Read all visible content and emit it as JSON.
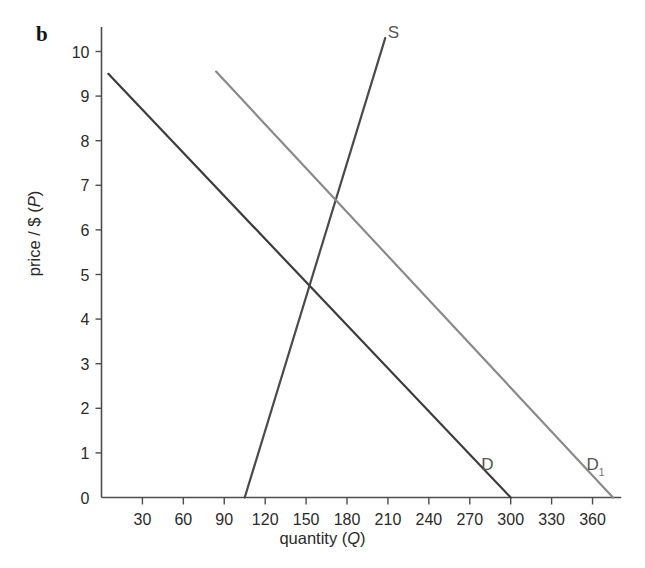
{
  "figure": {
    "panel_label": "b",
    "background": "#ffffff"
  },
  "chart_data": {
    "type": "line",
    "title": "",
    "xlabel": "quantity (Q)",
    "ylabel": "price / $ (P)",
    "xlabel_plain": "quantity",
    "xlabel_italic": "Q",
    "ylabel_plain": "price / $",
    "ylabel_italic": "P",
    "xlim": [
      0,
      375
    ],
    "ylim": [
      0,
      10
    ],
    "xticks": [
      0,
      30,
      60,
      90,
      120,
      150,
      180,
      210,
      240,
      270,
      300,
      330,
      360
    ],
    "xtick_labels": [
      "0",
      "30",
      "60",
      "90",
      "120",
      "150",
      "180",
      "210",
      "240",
      "270",
      "300",
      "330",
      "360"
    ],
    "yticks": [
      0,
      1,
      2,
      3,
      4,
      5,
      6,
      7,
      8,
      9,
      10
    ],
    "ytick_labels": [
      "0",
      "1",
      "2",
      "3",
      "4",
      "5",
      "6",
      "7",
      "8",
      "9",
      "10"
    ],
    "grid": false,
    "legend_position": "inline-end-labels",
    "series": [
      {
        "name": "D",
        "label": "D",
        "label_sub": "",
        "color": "#3c3c3c",
        "width": 2.2,
        "points": [
          [
            5,
            9.5
          ],
          [
            300,
            0
          ]
        ],
        "label_at": [
          283,
          0.62
        ]
      },
      {
        "name": "S",
        "label": "S",
        "label_sub": "",
        "color": "#4a4a4a",
        "width": 2.2,
        "points": [
          [
            105,
            0
          ],
          [
            208,
            10.3
          ]
        ],
        "label_at": [
          214,
          10.3
        ]
      },
      {
        "name": "D1",
        "label": "D",
        "label_sub": "1",
        "color": "#8a8a8a",
        "width": 2.2,
        "points": [
          [
            84,
            9.55
          ],
          [
            375,
            0
          ]
        ],
        "label_at": [
          360,
          0.62
        ]
      }
    ],
    "intersections": [
      {
        "name": "equilibrium-D-S",
        "q": 150,
        "p": 4.95
      },
      {
        "name": "equilibrium-D1-S",
        "q": 180,
        "p": 6.8
      }
    ],
    "annotations": [
      {
        "name": "panel-letter",
        "text": "b"
      }
    ]
  }
}
